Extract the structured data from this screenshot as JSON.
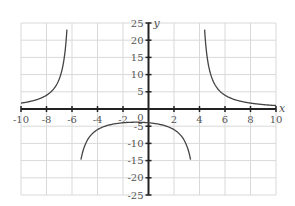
{
  "chart_data": {
    "type": "line",
    "title": "",
    "xlabel": "x",
    "ylabel": "y",
    "xlim": [
      -10,
      10
    ],
    "ylim": [
      -25,
      25
    ],
    "grid": true,
    "x_ticks": [
      -10,
      -8,
      -6,
      -4,
      -2,
      2,
      4,
      6,
      8,
      10
    ],
    "y_ticks": [
      -25,
      -20,
      -15,
      -10,
      -5,
      5,
      10,
      15,
      20,
      25
    ],
    "origin_label": "0",
    "vertical_asymptotes": [
      -6,
      4
    ],
    "function_estimate": "y = 96 / ((x + 6)(x - 4))",
    "series": [
      {
        "name": "left branch",
        "x": [
          -10,
          -9,
          -8,
          -7.5,
          -7,
          -6.5,
          -6.4
        ],
        "y": [
          1.71,
          2.46,
          4.0,
          5.33,
          8.73,
          18.3,
          25
        ]
      },
      {
        "name": "middle branch",
        "x": [
          -5.3,
          -5,
          -4,
          -3,
          -2,
          -1,
          0,
          1,
          2,
          3,
          3.3
        ],
        "y": [
          -25,
          -10.7,
          -4.8,
          -4.57,
          -4.0,
          -3.84,
          -4.0,
          -4.57,
          -4.8,
          -10.7,
          -25
        ]
      },
      {
        "name": "right branch",
        "x": [
          4.4,
          5,
          6,
          7,
          8,
          9,
          10
        ],
        "y": [
          25,
          8.73,
          4.0,
          2.46,
          1.71,
          1.28,
          1.0
        ]
      }
    ],
    "colors": {
      "curve": "#444444",
      "axis": "#222222",
      "grid": "#d9d9d9",
      "labels": "#555555"
    }
  }
}
